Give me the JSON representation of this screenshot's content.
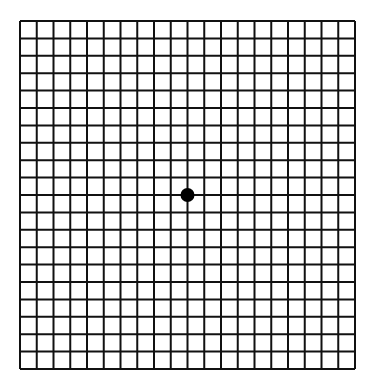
{
  "diagram": {
    "type": "amsler-grid",
    "grid": {
      "columns": 20,
      "rows": 20,
      "left": 20,
      "top": 21,
      "right": 355,
      "bottom": 369,
      "line_color": "#111111",
      "line_width": 2
    },
    "fixation_dot": {
      "column": 10,
      "row": 10,
      "radius": 7,
      "color": "#000000"
    },
    "background": "#ffffff"
  }
}
